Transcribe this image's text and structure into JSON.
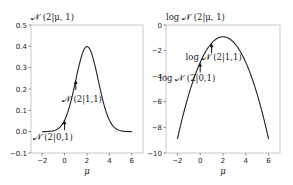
{
  "chart_data": [
    {
      "type": "line",
      "title": "𝒩 (2|μ, 1)",
      "xlabel": "μ",
      "ylabel": "",
      "xlim": [
        -3,
        7
      ],
      "ylim": [
        -0.1,
        0.5
      ],
      "xticks": [
        -2,
        0,
        2,
        4,
        6
      ],
      "xtick_labels": [
        "−2",
        "0",
        "2",
        "4",
        "6"
      ],
      "yticks": [
        -0.1,
        0.0,
        0.1,
        0.2,
        0.3,
        0.4,
        0.5
      ],
      "ytick_labels": [
        "−0.1",
        "0.0",
        "0.1",
        "0.2",
        "0.3",
        "0.4",
        "0.5"
      ],
      "grid": false,
      "series": [
        {
          "name": "𝒩 (2|μ, 1)",
          "function": "normal_pdf",
          "x_range": [
            -2,
            6
          ],
          "x": [
            -2,
            -1,
            0,
            1,
            2,
            3,
            4,
            5,
            6
          ],
          "y": [
            0.0001,
            0.0044,
            0.054,
            0.242,
            0.399,
            0.242,
            0.054,
            0.0044,
            0.0001
          ]
        }
      ],
      "annotations": [
        {
          "text": "𝒩 (2|1,1)",
          "x": 1,
          "y": 0.242
        },
        {
          "text": "𝒩 (2|0,1)",
          "x": 0,
          "y": 0.054
        }
      ]
    },
    {
      "type": "line",
      "title": "log 𝒩 (2|μ, 1)",
      "xlabel": "μ",
      "ylabel": "",
      "xlim": [
        -3,
        7
      ],
      "ylim": [
        -10,
        0
      ],
      "xticks": [
        -2,
        0,
        2,
        4,
        6
      ],
      "xtick_labels": [
        "−2",
        "0",
        "2",
        "4",
        "6"
      ],
      "yticks": [
        -10,
        -8,
        -6,
        -4,
        -2,
        0
      ],
      "ytick_labels": [
        "−10",
        "−8",
        "−6",
        "−4",
        "−2",
        "0"
      ],
      "grid": false,
      "series": [
        {
          "name": "log 𝒩 (2|μ, 1)",
          "function": "normal_logpdf",
          "x_range": [
            -2,
            6
          ],
          "x": [
            -2,
            -1,
            0,
            1,
            2,
            3,
            4,
            5,
            6
          ],
          "y": [
            -8.92,
            -5.42,
            -2.92,
            -1.42,
            -0.92,
            -1.42,
            -2.92,
            -5.42,
            -8.92
          ]
        }
      ],
      "annotations": [
        {
          "text": "log 𝒩 (2|1,1)",
          "x": 1,
          "y": -1.42
        },
        {
          "text": "log 𝒩 (2|0,1)",
          "x": 0,
          "y": -2.92
        }
      ]
    }
  ]
}
